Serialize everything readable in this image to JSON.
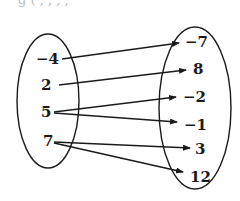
{
  "header_fragment": "g ( , , , ,",
  "domain_set": {
    "name": "domain",
    "values": [
      "−4",
      "2",
      "5",
      "7"
    ]
  },
  "range_set": {
    "name": "range",
    "values": [
      "−7",
      "8",
      "−2",
      "−1",
      "3",
      "12"
    ]
  },
  "mappings": [
    {
      "from": "−4",
      "to": "−7"
    },
    {
      "from": "2",
      "to": "8"
    },
    {
      "from": "5",
      "to": "−2"
    },
    {
      "from": "5",
      "to": "−1"
    },
    {
      "from": "7",
      "to": "3"
    },
    {
      "from": "7",
      "to": "12"
    }
  ],
  "colors": {
    "stroke": "#1a1a1a",
    "background": "#ffffff"
  }
}
